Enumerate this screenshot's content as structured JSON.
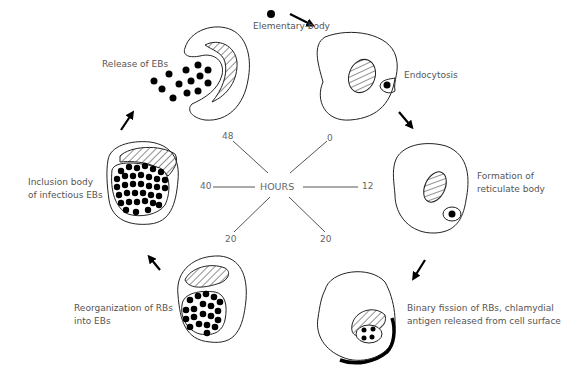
{
  "diagram": {
    "center_label": "HOURS",
    "hour_marks": [
      "0",
      "12",
      "20",
      "20",
      "40",
      "48"
    ],
    "stages": [
      {
        "id": "elementary-body",
        "label": "Elementary body"
      },
      {
        "id": "endocytosis",
        "label": "Endocytosis"
      },
      {
        "id": "formation",
        "label_line1": "Formation of",
        "label_line2": "reticulate body"
      },
      {
        "id": "binary-fission",
        "label_line1": "Binary fission of RBs, chlamydial",
        "label_line2": "antigen released from cell surface"
      },
      {
        "id": "reorganization",
        "label_line1": "Reorganization of RBs",
        "label_line2": "into EBs"
      },
      {
        "id": "inclusion",
        "label_line1": "Inclusion body",
        "label_line2": "of infectious EBs"
      },
      {
        "id": "release",
        "label": "Release of EBs"
      }
    ]
  }
}
